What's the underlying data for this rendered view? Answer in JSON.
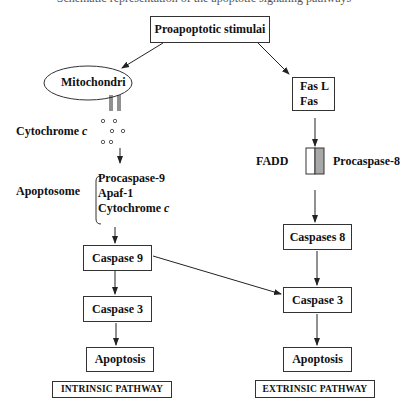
{
  "diagram": {
    "truncated_header_text": "Schematic representation of the apoptotic signaling pathways",
    "root": {
      "label": "Proapoptotic stimulai"
    },
    "intrinsic": {
      "mitochondria_label": "Mitochondri",
      "cytochrome_label": "Cytochrome",
      "cytochrome_italic": "c",
      "apoptosome_label": "Apoptosome",
      "apoptosome_components": [
        "Procaspase-9",
        "Apaf-1",
        "Cytochrome"
      ],
      "apoptosome_italic": "c",
      "caspase9": "Caspase 9",
      "caspase3": "Caspase 3",
      "apoptosis": "Apoptosis",
      "pathway_label": "INTRINSIC PATHWAY"
    },
    "extrinsic": {
      "receptor_lines": [
        "Fas L",
        "Fas"
      ],
      "fadd_label": "FADD",
      "procaspase8_label": "Procaspase-8",
      "caspase8": "Caspases 8",
      "caspase3": "Caspase 3",
      "apoptosis": "Apoptosis",
      "pathway_label": "EXTRINSIC PATHWAY"
    },
    "colors": {
      "line": "#222222",
      "border": "#333333",
      "procaspase_fill": "#a8a8a8"
    }
  }
}
